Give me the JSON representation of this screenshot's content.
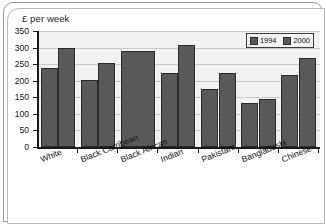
{
  "chart_data": {
    "type": "bar",
    "title": "£ per week",
    "xlabel": "",
    "ylabel": "£ per week",
    "ylim": [
      0,
      350
    ],
    "yticks": [
      0,
      50,
      100,
      150,
      200,
      250,
      300,
      350
    ],
    "grid": true,
    "legend_position": "top-right",
    "categories": [
      "White",
      "Black Carribean",
      "Black African",
      "Indian",
      "Pakistani",
      "Bangladeshi",
      "Chinese"
    ],
    "series": [
      {
        "name": "1994",
        "color": "#595959",
        "values": [
          237,
          201,
          290,
          222,
          175,
          133,
          218
        ]
      },
      {
        "name": "2000",
        "color": "#595959",
        "values": [
          300,
          255,
          290,
          307,
          222,
          145,
          268
        ]
      }
    ]
  },
  "legend": {
    "items": [
      {
        "label": "1994"
      },
      {
        "label": "2000"
      }
    ]
  },
  "axes": {
    "y_tick_labels": [
      "350",
      "300",
      "250",
      "200",
      "150",
      "100",
      "50",
      "0"
    ]
  }
}
